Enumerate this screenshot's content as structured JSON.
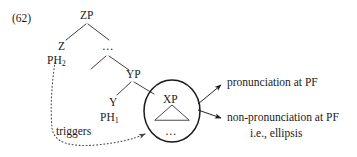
{
  "figure": {
    "number": "(62)",
    "type": "syntax-tree-diagram"
  },
  "tree": {
    "root": {
      "label": "ZP"
    },
    "nodes": [
      {
        "id": "zp",
        "label": "ZP"
      },
      {
        "id": "z",
        "label": "Z"
      },
      {
        "id": "ph2",
        "label": "PH",
        "subscript": "2"
      },
      {
        "id": "ellipsis-mid",
        "label": "…"
      },
      {
        "id": "yp",
        "label": "YP"
      },
      {
        "id": "y",
        "label": "Y"
      },
      {
        "id": "ph1",
        "label": "PH",
        "subscript": "1"
      },
      {
        "id": "xp",
        "label": "XP"
      },
      {
        "id": "xp-dots",
        "label": "…"
      }
    ]
  },
  "annotations": {
    "triggers_label": "triggers",
    "outcomes": [
      {
        "id": "outcome-pronunciation",
        "text": "pronunciation at PF",
        "text2": ""
      },
      {
        "id": "outcome-non-pronunciation",
        "text": "non-pronunciation at PF",
        "text2": "i.e., ellipsis"
      }
    ]
  },
  "colors": {
    "ink": "#1a1a1a",
    "line": "#2a2a2a",
    "background": "#ffffff"
  }
}
